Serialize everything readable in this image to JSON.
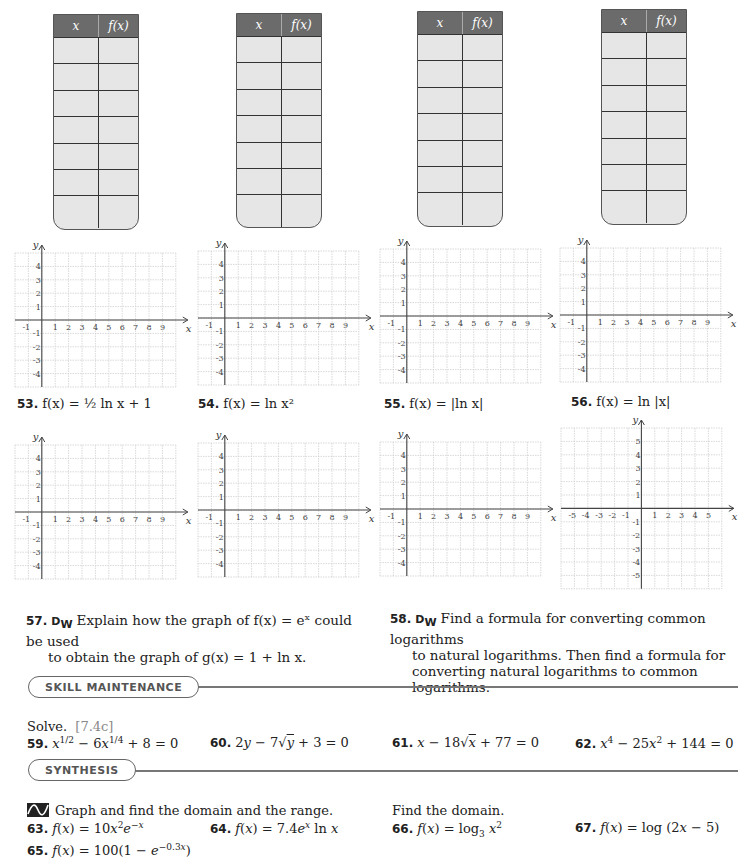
{
  "tables": {
    "header_x": "x",
    "header_fx": "f(x)",
    "count": 4,
    "rows_per_table": 7
  },
  "graphs_row1": [
    {
      "id": "53",
      "caption_num": "53.",
      "caption_text": "f(x) = ½ ln x + 1"
    },
    {
      "id": "54",
      "caption_num": "54.",
      "caption_text": "f(x) = ln x²"
    },
    {
      "id": "55",
      "caption_num": "55.",
      "caption_text": "f(x) = |ln x|"
    },
    {
      "id": "56",
      "caption_num": "56.",
      "caption_text": "f(x) = ln |x|"
    }
  ],
  "graph_axes": {
    "x_label": "x",
    "y_label": "y",
    "standard_x_ticks": [
      "-1",
      "1",
      "2",
      "3",
      "4",
      "5",
      "6",
      "7",
      "8",
      "9"
    ],
    "standard_y_ticks": [
      "4",
      "3",
      "2",
      "1",
      "-1",
      "-2",
      "-3",
      "-4"
    ],
    "centered_x_ticks": [
      "-5",
      "-4",
      "-3",
      "-2",
      "-1",
      "1",
      "2",
      "3",
      "4",
      "5"
    ],
    "centered_y_ticks": [
      "5",
      "4",
      "3",
      "2",
      "1",
      "-1",
      "-2",
      "-3",
      "-4",
      "-5"
    ]
  },
  "problems": {
    "p57": {
      "num": "57.",
      "dw": "D",
      "dw_sub": "W",
      "line1": "Explain how the graph of f(x) = eˣ could be used",
      "line2": "to obtain the graph of g(x) = 1 + ln x."
    },
    "p58": {
      "num": "58.",
      "dw": "D",
      "dw_sub": "W",
      "line1": "Find a formula for converting common logarithms",
      "line2": "to natural logarithms. Then find a formula for",
      "line3": "converting natural logarithms to common",
      "line4": "logarithms."
    }
  },
  "skill_maintenance": {
    "title": "SKILL MAINTENANCE",
    "instruction": "Solve.",
    "ref": "[7.4c]",
    "items": [
      {
        "num": "59.",
        "text": "x^(1/2) − 6x^(1/4) + 8 = 0"
      },
      {
        "num": "60.",
        "text": "2y − 7√y + 3 = 0"
      },
      {
        "num": "61.",
        "text": "x − 18√x + 77 = 0"
      },
      {
        "num": "62.",
        "text": "x⁴ − 25x² + 144 = 0"
      }
    ]
  },
  "synthesis": {
    "title": "SYNTHESIS",
    "graph_instruction": "Graph and find the domain and the range.",
    "domain_instruction": "Find the domain.",
    "items": [
      {
        "num": "63.",
        "text": "f(x) = 10x²e^(−x)"
      },
      {
        "num": "64.",
        "text": "f(x) = 7.4eˣ ln x"
      },
      {
        "num": "65.",
        "text": "f(x) = 100(1 − e^(−0.3x))"
      },
      {
        "num": "66.",
        "text": "f(x) = log₃ x²"
      },
      {
        "num": "67.",
        "text": "f(x) = log (2x − 5)"
      }
    ]
  }
}
